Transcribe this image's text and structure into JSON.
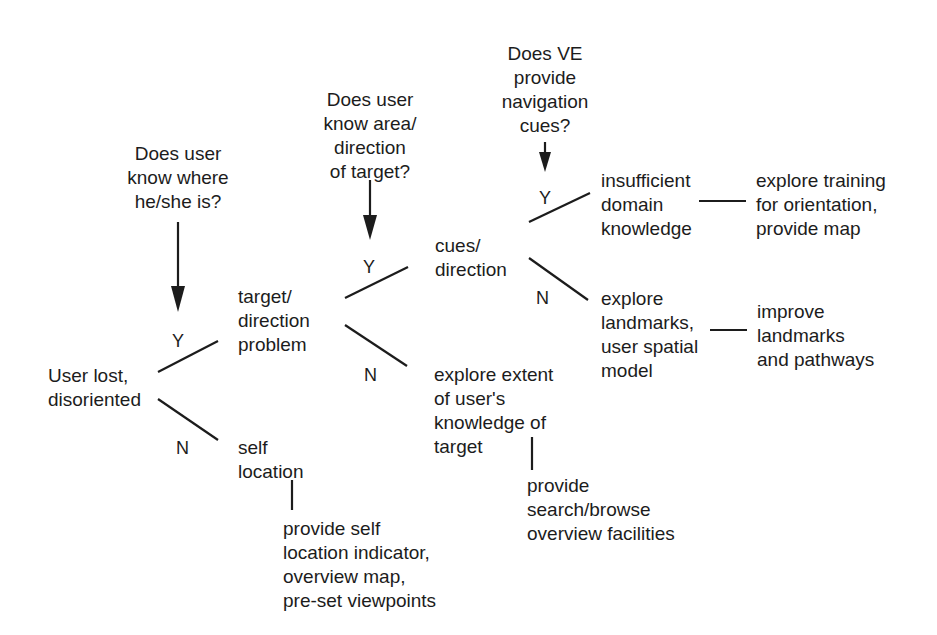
{
  "diagram": {
    "type": "decision-tree",
    "questions": {
      "q1": "Does user\nknow where\nhe/she is?",
      "q2": "Does user\nknow area/\ndirection\nof target?",
      "q3": "Does VE\nprovide\nnavigation\ncues?"
    },
    "nodes": {
      "root": "User lost,\ndisoriented",
      "target_direction": "target/\ndirection\nproblem",
      "self_location": "self\nlocation",
      "cues_direction": "cues/\ndirection",
      "explore_extent": "explore extent\nof user's\nknowledge of\ntarget",
      "insufficient_domain": "insufficient\ndomain\nknowledge",
      "explore_landmarks": "explore\nlandmarks,\nuser spatial\nmodel"
    },
    "recommendations": {
      "self_location": "provide self\nlocation indicator,\noverview map,\npre-set viewpoints",
      "search_browse": "provide\nsearch/browse\noverview facilities",
      "training": "explore training\nfor orientation,\nprovide map",
      "landmarks": "improve\nlandmarks\nand pathways"
    },
    "branch_labels": {
      "root_yes": "Y",
      "root_no": "N",
      "target_yes": "Y",
      "target_no": "N",
      "cues_yes": "Y",
      "cues_no": "N"
    }
  }
}
